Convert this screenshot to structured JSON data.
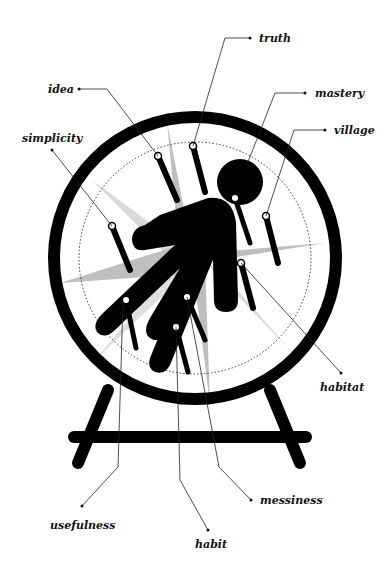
{
  "diagram": {
    "colors": {
      "ink": "#000000",
      "star": "#b8b8b8",
      "background": "#ffffff",
      "label": "#111111"
    },
    "labels": [
      {
        "id": "truth",
        "text": "truth"
      },
      {
        "id": "idea",
        "text": "idea"
      },
      {
        "id": "mastery",
        "text": "mastery"
      },
      {
        "id": "simplicity",
        "text": "simplicity"
      },
      {
        "id": "village",
        "text": "village"
      },
      {
        "id": "habitat",
        "text": "habitat"
      },
      {
        "id": "messiness",
        "text": "messiness"
      },
      {
        "id": "usefulness",
        "text": "usefulness"
      },
      {
        "id": "habit",
        "text": "habit"
      }
    ]
  }
}
